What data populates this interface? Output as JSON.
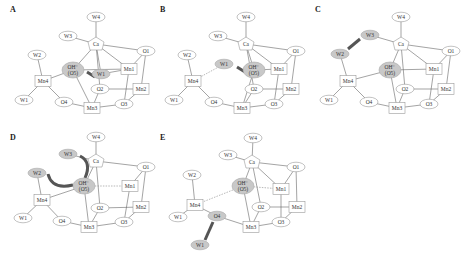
{
  "figure": {
    "panels": [
      {
        "label": "A",
        "ox": 0,
        "oy": 0,
        "highlight": [
          "OH",
          "Wc"
        ],
        "moving": {
          "name": "W1c_label",
          "text": "W1"
        },
        "arrow": "A"
      },
      {
        "label": "B",
        "ox": 150,
        "oy": 0,
        "highlight": [
          "OH",
          "Wc"
        ],
        "arrow": "B"
      },
      {
        "label": "C",
        "ox": 305,
        "oy": 0,
        "highlight": [
          "OH",
          "W2",
          "W3"
        ],
        "arrow": "C"
      },
      {
        "label": "D",
        "ox": 0,
        "oy": 128,
        "highlight": [
          "OH",
          "W2",
          "W3"
        ],
        "arrow": "D"
      },
      {
        "label": "E",
        "ox": 150,
        "oy": 128,
        "highlight": [
          "OH",
          "O4",
          "Wx"
        ],
        "arrow": "E"
      }
    ],
    "node_labels": {
      "W1": "W1",
      "W2": "W2",
      "W3": "W3",
      "W4": "W4",
      "Ca": "Ca",
      "O1": "O1",
      "O2": "O2",
      "O3": "O3",
      "O4": "O4",
      "Mn1": "Mn1",
      "Mn2": "Mn2",
      "Mn3": "Mn3",
      "Mn4": "Mn4",
      "OH_line1": "OH⁻",
      "OH_line2": "(O5)",
      "Wc": "W1",
      "Wx": "W1"
    },
    "colors": {
      "highlight": "#c8c8c8",
      "arrow": "#555555",
      "edge": "#666666"
    }
  }
}
